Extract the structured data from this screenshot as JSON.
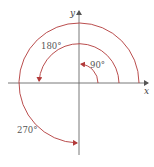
{
  "diagram": {
    "type": "rotation-angles-on-axes",
    "axes": {
      "x_label": "x",
      "y_label": "y",
      "color": "#6a6a6a"
    },
    "arc_color": "#b23a3a",
    "arcs": [
      {
        "angle_label": "90°",
        "degrees": 90,
        "direction": "counterclockwise"
      },
      {
        "angle_label": "180°",
        "degrees": 180,
        "direction": "counterclockwise"
      },
      {
        "angle_label": "270°",
        "degrees": 270,
        "direction": "counterclockwise"
      }
    ]
  }
}
